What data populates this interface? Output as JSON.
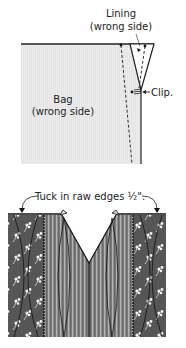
{
  "figure_top": {
    "label_lining_line1": "Lining",
    "label_lining_line2": "(wrong side)",
    "label_bag_line1": "Bag",
    "label_bag_line2": "(wrong side)",
    "label_clip": "Clip."
  },
  "figure_bottom": {
    "label_tuck": "Tuck in raw edges ½\"."
  },
  "colors": {
    "bag_fill": "#e6e6e6",
    "outline": "#222222",
    "floral_fabric": "#5a5a5a",
    "stripe_fabric": "#8a8a8a"
  }
}
